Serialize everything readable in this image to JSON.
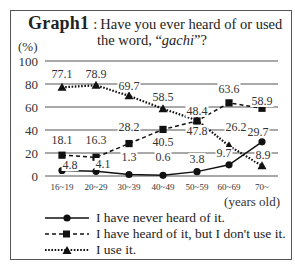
{
  "title": {
    "bold": "Graph1",
    "colon": ":",
    "line1": "Have you ever heard of or used",
    "line2_pre": "the word, “",
    "line2_word": "gachi",
    "line2_post": "”?"
  },
  "unit_label": "(%)",
  "xlabel": "(years old)",
  "legend": [
    {
      "label": "I have never heard of it.",
      "marker": "circle",
      "line": "solid"
    },
    {
      "label": "I have heard of it, but I don't use it.",
      "marker": "square",
      "line": "dashed"
    },
    {
      "label": "I use it.",
      "marker": "triangle",
      "line": "dotted"
    }
  ],
  "chart_data": {
    "type": "line",
    "xlabel": "(years old)",
    "ylabel": "(%)",
    "ylim": [
      0,
      100
    ],
    "yticks": [
      0,
      20,
      40,
      60,
      80,
      100
    ],
    "grid": true,
    "legend_position": "bottom",
    "categories": [
      "16~19",
      "20~29",
      "30~39",
      "40~49",
      "50~59",
      "60~69",
      "70~"
    ],
    "series": [
      {
        "name": "I have never heard of it.",
        "marker": "circle",
        "line": "solid",
        "values": [
          4.8,
          4.1,
          1.3,
          0.6,
          3.8,
          9.7,
          29.7
        ]
      },
      {
        "name": "I have heard of it, but I don't use it.",
        "marker": "square",
        "line": "dashed",
        "values": [
          18.1,
          16.3,
          28.2,
          40.5,
          47.8,
          63.6,
          58.9
        ]
      },
      {
        "name": "I use it.",
        "marker": "triangle",
        "line": "dotted",
        "values": [
          77.1,
          78.9,
          69.7,
          58.5,
          48.4,
          26.2,
          8.9
        ]
      }
    ]
  }
}
